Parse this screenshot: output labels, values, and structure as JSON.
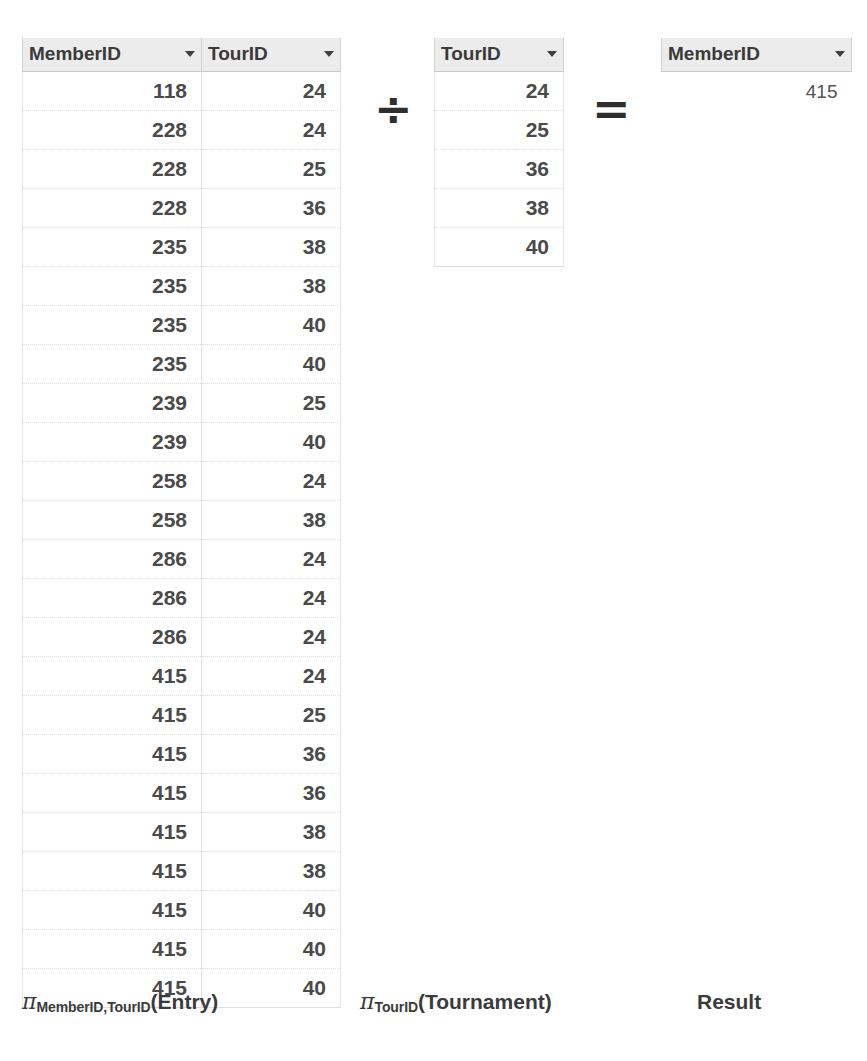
{
  "figure": {
    "caret_icon": "chevron-down-icon"
  },
  "entry_table": {
    "name": "Entry projection",
    "columns": [
      "MemberID",
      "TourID"
    ],
    "rows": [
      [
        "118",
        "24"
      ],
      [
        "228",
        "24"
      ],
      [
        "228",
        "25"
      ],
      [
        "228",
        "36"
      ],
      [
        "235",
        "38"
      ],
      [
        "235",
        "38"
      ],
      [
        "235",
        "40"
      ],
      [
        "235",
        "40"
      ],
      [
        "239",
        "25"
      ],
      [
        "239",
        "40"
      ],
      [
        "258",
        "24"
      ],
      [
        "258",
        "38"
      ],
      [
        "286",
        "24"
      ],
      [
        "286",
        "24"
      ],
      [
        "286",
        "24"
      ],
      [
        "415",
        "24"
      ],
      [
        "415",
        "25"
      ],
      [
        "415",
        "36"
      ],
      [
        "415",
        "36"
      ],
      [
        "415",
        "38"
      ],
      [
        "415",
        "38"
      ],
      [
        "415",
        "40"
      ],
      [
        "415",
        "40"
      ],
      [
        "415",
        "40"
      ]
    ],
    "caption": {
      "operator": "π",
      "subscript": "MemberID,TourID",
      "relation": "(Entry)"
    }
  },
  "tournament_table": {
    "name": "Tournament projection",
    "columns": [
      "TourID"
    ],
    "rows": [
      [
        "24"
      ],
      [
        "25"
      ],
      [
        "36"
      ],
      [
        "38"
      ],
      [
        "40"
      ]
    ],
    "caption": {
      "operator": "π",
      "subscript": "TourID",
      "relation": "(Tournament)"
    }
  },
  "result_table": {
    "name": "Result",
    "columns": [
      "MemberID"
    ],
    "rows": [
      [
        "415"
      ]
    ],
    "caption": {
      "label": "Result"
    }
  },
  "operators": {
    "divide": "÷",
    "equals": "="
  },
  "colors": {
    "header_background": "#ececec",
    "header_text": "#3a3a3a",
    "cell_text": "#4a4a4a",
    "row_separator": "#dcdcdc",
    "operator_text": "#2e2e2e",
    "page_background": "#ffffff"
  }
}
